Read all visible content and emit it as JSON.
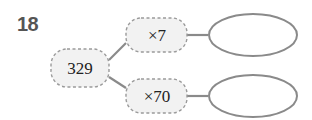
{
  "problem": {
    "number": "18",
    "start_value": "329",
    "operations": [
      {
        "label": "×7",
        "result": ""
      },
      {
        "label": "×70",
        "result": ""
      }
    ]
  },
  "colors": {
    "line": "#8a8a8a",
    "dashed_border": "#9a9a9a",
    "box_fill": "#f2f2f2",
    "number_text": "#555555"
  }
}
